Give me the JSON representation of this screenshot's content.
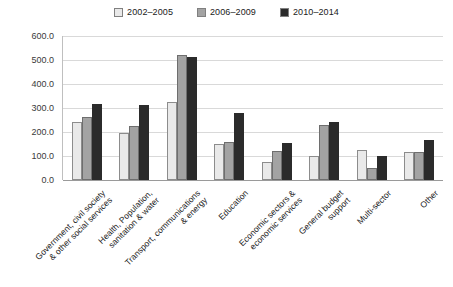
{
  "chart_data": {
    "type": "bar",
    "title": "",
    "xlabel": "",
    "ylabel": "",
    "ylim": [
      0,
      600
    ],
    "ytick_step": 100,
    "ytick_labels": [
      "600.0",
      "500.0",
      "400.0",
      "300.0",
      "200.0",
      "100.0",
      "0.0"
    ],
    "ytick_values": [
      600,
      500,
      400,
      300,
      200,
      100,
      0
    ],
    "grid": true,
    "legend_position": "top-center",
    "categories": [
      "Government, civil society\n& other social services",
      "Health, Population,\nsanitation & water",
      "Transport, communications\n& energy",
      "Education",
      "Economic sectors &\neconomic services",
      "General budget\nsupport",
      "Multi-sector",
      "Other"
    ],
    "series": [
      {
        "name": "2002–2005",
        "color": "#e9e9e9",
        "values": [
          240,
          196,
          325,
          148,
          75,
          100,
          125,
          118
        ]
      },
      {
        "name": "2006–2009",
        "color": "#a3a3a3",
        "values": [
          263,
          225,
          520,
          158,
          120,
          228,
          48,
          115
        ]
      },
      {
        "name": "2010–2014",
        "color": "#2b2b2b",
        "values": [
          315,
          313,
          512,
          280,
          153,
          243,
          100,
          168
        ]
      }
    ]
  }
}
